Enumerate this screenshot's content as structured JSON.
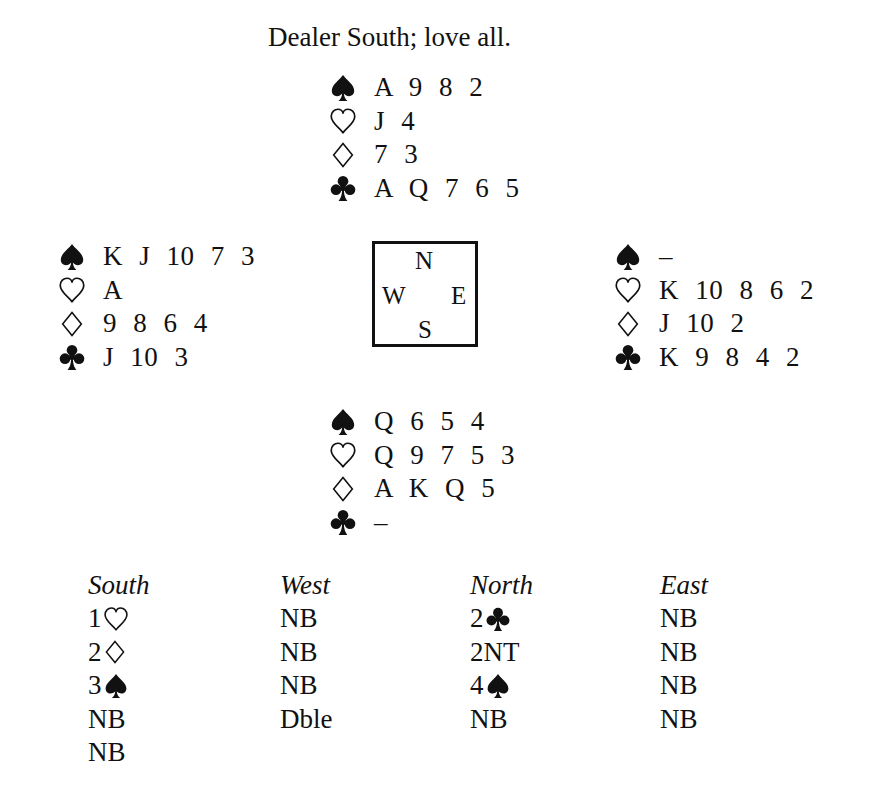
{
  "header": {
    "title": "Dealer South; love all."
  },
  "hands": {
    "north": {
      "spades": "A 9 8 2",
      "hearts": "J 4",
      "diamonds": "7 3",
      "clubs": "A Q 7 6 5"
    },
    "west": {
      "spades": "K J 10 7 3",
      "hearts": "A",
      "diamonds": "9 8 6 4",
      "clubs": "J 10 3"
    },
    "east": {
      "spades": "–",
      "hearts": "K 10 8 6 2",
      "diamonds": "J 10 2",
      "clubs": "K 9 8 4 2"
    },
    "south": {
      "spades": "Q 6 5 4",
      "hearts": "Q 9 7 5 3",
      "diamonds": "A K Q 5",
      "clubs": "–"
    }
  },
  "compass": {
    "north": "N",
    "west": "W",
    "east": "E",
    "south": "S"
  },
  "bidding": {
    "headers": [
      "South",
      "West",
      "North",
      "East"
    ],
    "south": [
      {
        "text": "1",
        "suit": "hearts"
      },
      {
        "text": "2",
        "suit": "diamonds"
      },
      {
        "text": "3",
        "suit": "spades"
      },
      {
        "text": "NB"
      },
      {
        "text": "NB"
      }
    ],
    "west": [
      {
        "text": "NB"
      },
      {
        "text": "NB"
      },
      {
        "text": "NB"
      },
      {
        "text": "Dble"
      }
    ],
    "north": [
      {
        "text": "2",
        "suit": "clubs"
      },
      {
        "text": "2NT"
      },
      {
        "text": "4",
        "suit": "spades"
      },
      {
        "text": "NB"
      }
    ],
    "east": [
      {
        "text": "NB"
      },
      {
        "text": "NB"
      },
      {
        "text": "NB"
      },
      {
        "text": "NB"
      }
    ]
  },
  "icons": {
    "spades": "spade-icon (filled)",
    "hearts": "heart-icon (outline)",
    "diamonds": "diamond-icon (outline)",
    "clubs": "club-icon (filled)"
  },
  "colors": {
    "ink": "#111111",
    "background": "#ffffff"
  }
}
